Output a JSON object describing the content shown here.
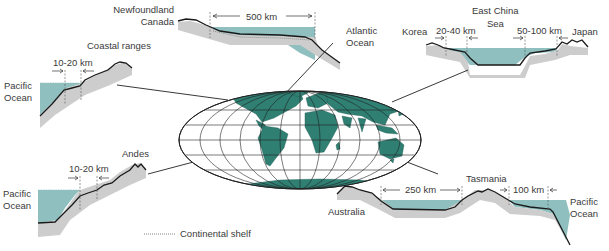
{
  "diagram": {
    "legend": {
      "continental_shelf": "Continental shelf"
    },
    "colors": {
      "ocean": "#8fbfbf",
      "land_crust": "#cdcdcd",
      "continent_fill": "#2f7f73",
      "profile_line": "#1a1a1a",
      "text": "#3a3a3a"
    },
    "profiles": [
      {
        "id": "newfoundland",
        "labels": [
          "Newfoundland",
          "Canada"
        ],
        "ocean": [
          "Atlantic",
          "Ocean"
        ],
        "width": "500 km"
      },
      {
        "id": "coastal-ranges",
        "labels": [
          "Coastal ranges"
        ],
        "ocean": [
          "Pacific",
          "Ocean"
        ],
        "width": "10-20 km"
      },
      {
        "id": "east-china-sea",
        "labels": [
          "East China",
          "Sea"
        ],
        "left_land": "Korea",
        "right_land": "Japan",
        "width_left": "20-40 km",
        "width_right": "50-100 km"
      },
      {
        "id": "andes",
        "labels": [
          "Andes"
        ],
        "ocean": [
          "Pacific",
          "Ocean"
        ],
        "width": "10-20 km"
      },
      {
        "id": "australia-tasmania",
        "left_land": "Australia",
        "island": "Tasmania",
        "ocean": [
          "Pacific",
          "Ocean"
        ],
        "width_left": "250 km",
        "width_right": "100 km"
      }
    ]
  }
}
